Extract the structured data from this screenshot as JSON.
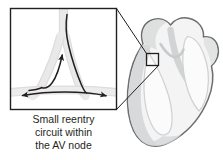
{
  "figure": {
    "name": "av-nodal-reentry-illustration",
    "background_color": "#ffffff"
  },
  "caption": {
    "lines": [
      "Small reentry",
      "circuit within",
      "the AV node"
    ],
    "full_text": "Small reentry circuit within the AV node",
    "text_color": "#231f20",
    "align": "center"
  },
  "inset": {
    "label": "av-node-magnified-inset",
    "border_color": "#231f20",
    "background_color": "#ffffff",
    "contents_description": "Magnified view of AV node showing dual pathway reentry circuit with directional arrows"
  },
  "heart": {
    "label": "heart-silhouette",
    "outline_color": "#6d6e71",
    "fill_color": "#f2f2f2",
    "shading_color": "#d9d9d9",
    "chamber_wall_color": "#c7c8ca",
    "marker": {
      "label": "av-node-location-marker",
      "shape": "square",
      "border_color": "#231f20"
    }
  },
  "connectors": {
    "label": "leader-lines",
    "color": "#231f20",
    "count": 2
  },
  "arrows": {
    "color": "#231f20",
    "items": [
      {
        "name": "upward-conduction-arrow",
        "direction": "up",
        "description": "Slow pathway retrograde conduction toward AV node"
      },
      {
        "name": "left-spreading-arrow",
        "direction": "left",
        "description": "Impulse spreading leftward along atrial tissue"
      },
      {
        "name": "right-spreading-arrow",
        "direction": "right",
        "description": "Impulse spreading rightward along atrial tissue"
      }
    ]
  },
  "pathways": {
    "color": "#e6e6e6",
    "edge_color": "#d0d0d0",
    "items": [
      {
        "name": "fast-pathway",
        "description": "Light gray conduction bundle, right limb"
      },
      {
        "name": "slow-pathway",
        "description": "Light gray conduction bundle, left limb"
      },
      {
        "name": "common-bundle",
        "description": "Vertical bundle above the node"
      },
      {
        "name": "atrial-band",
        "description": "Horizontal tissue band at base"
      }
    ]
  }
}
